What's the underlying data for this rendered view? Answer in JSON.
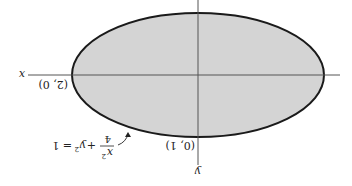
{
  "figure": {
    "orientation": "rotated-180",
    "ellipse": {
      "equation_parts": {
        "x2": "x",
        "sup": "2",
        "den": "4",
        "plus": "+",
        "y2": "y",
        "eq": "= 1"
      },
      "fill": "#d4d4d4",
      "stroke": "#1a1a1a",
      "a": 2,
      "b": 1
    },
    "axes": {
      "x_label": "x",
      "y_label": "y",
      "color": "#555555"
    },
    "points": [
      {
        "label": "(2, 0)",
        "x": 2,
        "y": 0
      },
      {
        "label": "(0, 1)",
        "x": 0,
        "y": 1
      }
    ]
  }
}
